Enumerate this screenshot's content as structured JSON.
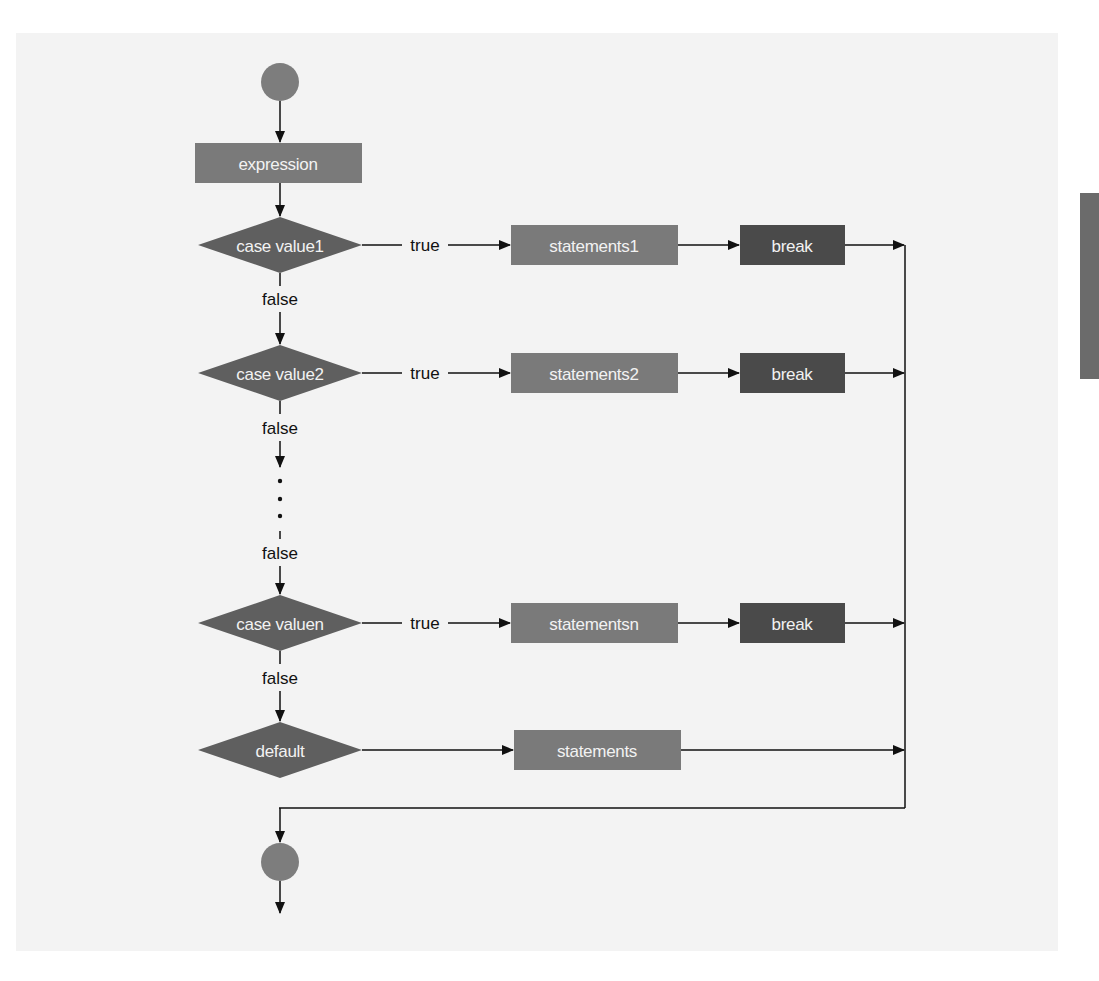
{
  "diagram": {
    "colors": {
      "panel_bg": "#f3f3f3",
      "node_fill": "#7a7a7a",
      "decision_fill": "#5f5f5f",
      "break_fill": "#4a4a4a",
      "circle_fill": "#7d7d7d",
      "line": "#111111",
      "node_text": "#f2f2f2",
      "side_tab": "#6b6b6b"
    },
    "nodes": {
      "start": {
        "type": "initial"
      },
      "expression": {
        "type": "action",
        "label": "expression"
      },
      "case1": {
        "type": "decision",
        "label": "case value1"
      },
      "case2": {
        "type": "decision",
        "label": "case value2"
      },
      "casen": {
        "type": "decision",
        "label": "case valuen"
      },
      "default": {
        "type": "decision",
        "label": "default"
      },
      "statements1": {
        "type": "action",
        "label": "statements1"
      },
      "statements2": {
        "type": "action",
        "label": "statements2"
      },
      "statementsn": {
        "type": "action",
        "label": "statementsn"
      },
      "statements": {
        "type": "action",
        "label": "statements"
      },
      "break1": {
        "type": "action",
        "label": "break"
      },
      "break2": {
        "type": "action",
        "label": "break"
      },
      "breakn": {
        "type": "action",
        "label": "break"
      },
      "end": {
        "type": "final"
      }
    },
    "edge_labels": {
      "true1": "true",
      "true2": "true",
      "truen": "true",
      "false1": "false",
      "false2": "false",
      "false_ellipsis": "false",
      "falsen": "false"
    },
    "ellipsis": "⋮",
    "edges": [
      {
        "from": "start",
        "to": "expression"
      },
      {
        "from": "expression",
        "to": "case1"
      },
      {
        "from": "case1",
        "to": "statements1",
        "label": "true"
      },
      {
        "from": "statements1",
        "to": "break1"
      },
      {
        "from": "break1",
        "to": "merge"
      },
      {
        "from": "case1",
        "to": "case2",
        "label": "false"
      },
      {
        "from": "case2",
        "to": "statements2",
        "label": "true"
      },
      {
        "from": "statements2",
        "to": "break2"
      },
      {
        "from": "break2",
        "to": "merge"
      },
      {
        "from": "case2",
        "to": "ellipsis",
        "label": "false"
      },
      {
        "from": "ellipsis",
        "to": "casen",
        "label": "false"
      },
      {
        "from": "casen",
        "to": "statementsn",
        "label": "true"
      },
      {
        "from": "statementsn",
        "to": "breakn"
      },
      {
        "from": "breakn",
        "to": "merge"
      },
      {
        "from": "casen",
        "to": "default",
        "label": "false"
      },
      {
        "from": "default",
        "to": "statements"
      },
      {
        "from": "statements",
        "to": "merge"
      },
      {
        "from": "merge",
        "to": "end"
      }
    ]
  }
}
